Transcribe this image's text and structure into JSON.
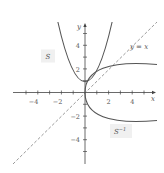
{
  "diagram": {
    "type": "function-and-inverse-graph",
    "axes": {
      "x_label": "x",
      "y_label": "y",
      "x_ticks": [
        "−4",
        "−2",
        "2",
        "4"
      ],
      "y_ticks": [
        "4",
        "2",
        "−2",
        "−4"
      ],
      "range": [
        -5,
        5
      ]
    },
    "curves": [
      {
        "id": "S",
        "label": "S",
        "equation": "y = x^2",
        "style": "solid",
        "color": "#555555"
      },
      {
        "id": "S_inverse",
        "label": "S",
        "label_superscript": "−1",
        "equation": "x = y^2",
        "style": "solid",
        "color": "#555555"
      },
      {
        "id": "identity",
        "label": "y = x",
        "equation": "y = x",
        "style": "dashed",
        "color": "#9a9a9a"
      }
    ],
    "colors": {
      "axis": "#444444",
      "curve": "#555555",
      "dashed_line": "#9a9a9a",
      "label_box": "#f0f0f0"
    }
  }
}
